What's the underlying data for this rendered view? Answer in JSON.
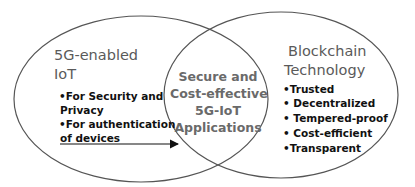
{
  "diagram": {
    "type": "venn",
    "colors": {
      "outline": "#555555",
      "title_text": "#5a5a5a",
      "bullet_text": "#111111",
      "center_text": "#6a6a6a",
      "background": "#ffffff"
    },
    "left_set": {
      "title_line1": "5G-enabled",
      "title_line2": "IoT",
      "bullets": [
        {
          "line1": "•For Security and",
          "line2": "Privacy"
        },
        {
          "line1": "•For authentication",
          "line2": "of devices"
        }
      ]
    },
    "right_set": {
      "title_line1": "Blockchain",
      "title_line2": "Technology",
      "bullets": [
        "•Trusted",
        "• Decentralized",
        "• Tempered-proof",
        "• Cost-efficient",
        "•Transparent"
      ]
    },
    "intersection": {
      "lines": [
        "Secure and",
        "Cost-effective",
        "5G-IoT",
        "Applications"
      ]
    }
  }
}
